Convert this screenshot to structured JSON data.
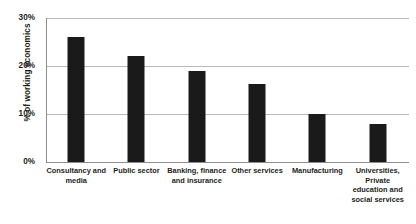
{
  "chart_data": {
    "type": "bar",
    "title": "",
    "subtitle": "",
    "xlabel": "",
    "ylabel": "% of working economics",
    "ylim": [
      0,
      30
    ],
    "yticks": [
      "0%",
      "10%",
      "20%",
      "30%"
    ],
    "ytick_values": [
      0,
      10,
      20,
      30
    ],
    "grid": true,
    "legend": false,
    "legend_position": "none",
    "orientation": "vertical",
    "bar_color": "#1a1a1a",
    "categories": [
      "Consultancy and media",
      "Public sector",
      "Banking, finance and insurance",
      "Other services",
      "Manufacturing",
      "Universities, Private education and social services"
    ],
    "category_lines": [
      [
        "Consultancy and",
        "media"
      ],
      [
        "Public sector"
      ],
      [
        "Banking, finance",
        "and insurance"
      ],
      [
        "Other services"
      ],
      [
        "Manufacturing"
      ],
      [
        "Universities,",
        "Private",
        "education and",
        "social services"
      ]
    ],
    "values": [
      26,
      22,
      19,
      16.3,
      10,
      8
    ],
    "value_labels": [
      "26%",
      "22%",
      "19%",
      "16.3%",
      "10%",
      "8%"
    ]
  }
}
